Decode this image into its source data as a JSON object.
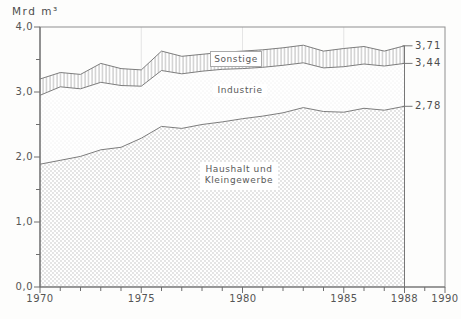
{
  "title": "Mrd m³",
  "colors": {
    "background": "#fdfdfc",
    "axis": "#6e6e6e",
    "plot_border": "#8f8f8f",
    "curve_line": "#7d7d7d",
    "faint_gridline": "#dedede",
    "haushalt_dots": "#b4b4b4",
    "industrie_dots": "#d2d2d2",
    "sonstige_hatch": "#b2b2b2",
    "text": "#555555"
  },
  "chart_data": {
    "type": "area",
    "stacked": true,
    "title": "Mrd m³",
    "xlabel": "",
    "ylabel": "Mrd m³",
    "xlim": [
      1970,
      1990
    ],
    "ylim": [
      0,
      4
    ],
    "grid": "faint vertical lines at 1975, 1980, 1985 only",
    "gridline_years": [
      1975,
      1980,
      1985
    ],
    "data_end_x": 1988,
    "x": [
      1970,
      1971,
      1972,
      1973,
      1974,
      1975,
      1976,
      1977,
      1978,
      1979,
      1980,
      1981,
      1982,
      1983,
      1984,
      1985,
      1986,
      1987,
      1988
    ],
    "values_are": "cumulative_stack_boundaries",
    "series": [
      {
        "name": "Haushalt und Kleingewerbe",
        "label_lines": [
          "Haushalt und",
          "Kleingewerbe"
        ],
        "end_label": "2,78",
        "values": [
          1.89,
          1.95,
          2.01,
          2.11,
          2.15,
          2.29,
          2.47,
          2.44,
          2.5,
          2.54,
          2.59,
          2.63,
          2.68,
          2.76,
          2.7,
          2.69,
          2.75,
          2.72,
          2.78
        ]
      },
      {
        "name": "Industrie",
        "label_lines": [
          "Industrie"
        ],
        "end_label": "3,44",
        "values": [
          2.95,
          3.08,
          3.05,
          3.15,
          3.1,
          3.09,
          3.33,
          3.28,
          3.32,
          3.35,
          3.36,
          3.38,
          3.41,
          3.45,
          3.37,
          3.39,
          3.43,
          3.4,
          3.44
        ]
      },
      {
        "name": "Sonstige",
        "label_lines": [
          "Sonstige"
        ],
        "end_label": "3,71",
        "values": [
          3.2,
          3.3,
          3.27,
          3.44,
          3.36,
          3.34,
          3.63,
          3.55,
          3.58,
          3.61,
          3.63,
          3.65,
          3.68,
          3.72,
          3.63,
          3.67,
          3.7,
          3.63,
          3.71
        ]
      }
    ],
    "x_tick_labels": [
      "1970",
      "1975",
      "1980",
      "1985",
      "1988",
      "1990"
    ],
    "x_tick_values": [
      1970,
      1975,
      1980,
      1985,
      1988,
      1990
    ],
    "x_minor_tick_step": 1,
    "y_tick_labels": [
      "0,0",
      "1,0",
      "2,0",
      "3,0",
      "4,0"
    ],
    "y_tick_values": [
      0,
      1,
      2,
      3,
      4
    ],
    "y_minor_tick_step": 0.5,
    "legend_position": "labels inside areas"
  }
}
